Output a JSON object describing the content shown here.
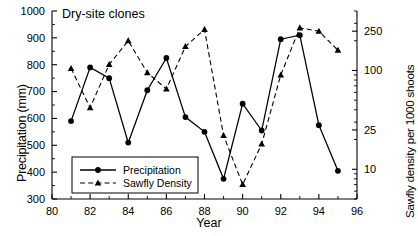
{
  "chart_data": {
    "type": "line",
    "title": "Dry-site clones",
    "xlabel": "Year",
    "ylabel": "Precipitation (mm)",
    "y2label": "Sawfly density per 1000 shoots",
    "x": [
      81,
      82,
      83,
      84,
      85,
      86,
      87,
      88,
      89,
      90,
      91,
      92,
      93,
      94,
      95
    ],
    "xlim": [
      80,
      96
    ],
    "xticks": [
      80,
      82,
      84,
      86,
      88,
      90,
      92,
      94,
      96
    ],
    "xticklabels": [
      "80",
      "82",
      "84",
      "86",
      "88",
      "90",
      "92",
      "94",
      "96"
    ],
    "xminorticks": [
      81,
      83,
      85,
      87,
      89,
      91,
      93,
      95
    ],
    "ylim": [
      300,
      1000
    ],
    "yticks": [
      300,
      400,
      500,
      600,
      700,
      800,
      900,
      1000
    ],
    "yticklabels": [
      "300",
      "400",
      "500",
      "600",
      "700",
      "800",
      "900",
      "1000"
    ],
    "y2scale": "log",
    "y2lim": [
      5,
      400
    ],
    "y2ticks": [
      10,
      25,
      100,
      250
    ],
    "y2ticklabels": [
      "10",
      "25",
      "100",
      "250"
    ],
    "grid": false,
    "legend_position": "lower left",
    "series": [
      {
        "name": "Precipitation",
        "axis": "left",
        "marker": "circle",
        "linestyle": "solid",
        "values": [
          590,
          790,
          750,
          510,
          705,
          825,
          605,
          550,
          375,
          655,
          555,
          895,
          910,
          575,
          405
        ]
      },
      {
        "name": "Sawfly Density",
        "axis": "right",
        "marker": "triangle",
        "linestyle": "dashed",
        "values": [
          105,
          42,
          115,
          200,
          95,
          65,
          175,
          260,
          22,
          7,
          18,
          90,
          270,
          250,
          160
        ]
      }
    ]
  },
  "legend": {
    "entries": [
      {
        "label": "Precipitation"
      },
      {
        "label": "Sawfly Density"
      }
    ]
  }
}
